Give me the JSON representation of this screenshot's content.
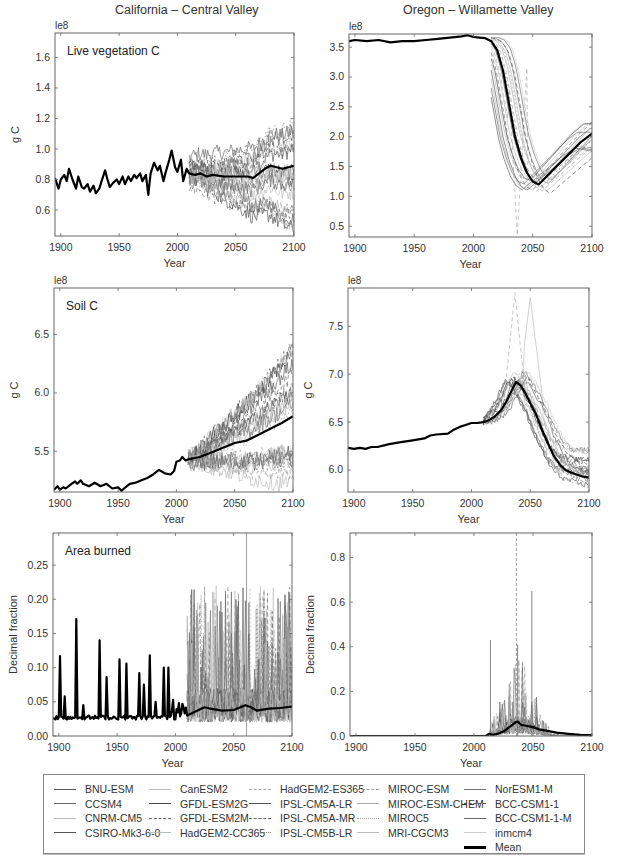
{
  "column_titles": [
    "California – Central Valley",
    "Oregon – Willamette Valley"
  ],
  "legend": {
    "items": [
      {
        "label": "BNU-ESM",
        "style": "solid",
        "color": "#555555",
        "width": 1
      },
      {
        "label": "CCSM4",
        "style": "solid",
        "color": "#666666",
        "width": 1
      },
      {
        "label": "CNRM-CM5",
        "style": "solid",
        "color": "#bbbbbb",
        "width": 1
      },
      {
        "label": "CSIRO-Mk3-6-0",
        "style": "solid",
        "color": "#555555",
        "width": 1
      },
      {
        "label": "CanESM2",
        "style": "solid",
        "color": "#bbbbbb",
        "width": 1
      },
      {
        "label": "GFDL-ESM2G",
        "style": "solid",
        "color": "#444444",
        "width": 1
      },
      {
        "label": "GFDL-ESM2M",
        "style": "dashed",
        "color": "#666666",
        "width": 1
      },
      {
        "label": "HadGEM2-CC365",
        "style": "solid",
        "color": "#bbbbbb",
        "width": 1
      },
      {
        "label": "HadGEM2-ES365",
        "style": "dashed",
        "color": "#aaaaaa",
        "width": 1
      },
      {
        "label": "IPSL-CM5A-LR",
        "style": "solid",
        "color": "#555555",
        "width": 1
      },
      {
        "label": "IPSL-CM5A-MR",
        "style": "dashed",
        "color": "#666666",
        "width": 1
      },
      {
        "label": "IPSL-CM5B-LR",
        "style": "dotted",
        "color": "#777777",
        "width": 1
      },
      {
        "label": "MIROC-ESM",
        "style": "dashed",
        "color": "#999999",
        "width": 1
      },
      {
        "label": "MIROC-ESM-CHEM",
        "style": "solid",
        "color": "#aaaaaa",
        "width": 1
      },
      {
        "label": "MIROC5",
        "style": "dotted",
        "color": "#aaaaaa",
        "width": 1
      },
      {
        "label": "MRI-CGCM3",
        "style": "solid",
        "color": "#bbbbbb",
        "width": 1
      },
      {
        "label": "NorESM1-M",
        "style": "solid",
        "color": "#777777",
        "width": 1
      },
      {
        "label": "BCC-CSM1-1",
        "style": "dashed",
        "color": "#555555",
        "width": 1
      },
      {
        "label": "BCC-CSM1-1-M",
        "style": "solid",
        "color": "#666666",
        "width": 1
      },
      {
        "label": "inmcm4",
        "style": "solid",
        "color": "#cccccc",
        "width": 1
      },
      {
        "label": "Mean",
        "style": "solid",
        "color": "#000000",
        "width": 3
      }
    ]
  },
  "chart_data": [
    {
      "id": "ca-live-veg",
      "type": "line",
      "title": "California – Central Valley",
      "annotation": "Live vegetation C",
      "ylabel": "g C",
      "xlabel": "Year",
      "offset_label": "le8",
      "xlim": [
        1895,
        2100
      ],
      "ylim": [
        0.43,
        1.76
      ],
      "xticks": [
        1900,
        1950,
        2000,
        2050,
        2100
      ],
      "yticks": [
        0.6,
        0.8,
        1.0,
        1.2,
        1.4,
        1.6
      ],
      "ytick_labels": [
        "0.6",
        "0.8",
        "1.0",
        "1.2",
        "1.4",
        "1.6"
      ],
      "mean": {
        "x": [
          1895,
          1898,
          1900,
          1903,
          1905,
          1907,
          1910,
          1913,
          1915,
          1918,
          1920,
          1923,
          1925,
          1928,
          1930,
          1933,
          1935,
          1938,
          1940,
          1942,
          1945,
          1948,
          1950,
          1953,
          1955,
          1958,
          1960,
          1963,
          1965,
          1968,
          1970,
          1973,
          1975,
          1977,
          1980,
          1983,
          1985,
          1988,
          1990,
          1993,
          1995,
          1998,
          2000,
          2003,
          2005,
          2008,
          2010,
          2015,
          2020,
          2025,
          2030,
          2040,
          2050,
          2060,
          2065,
          2070,
          2075,
          2080,
          2085,
          2090,
          2095,
          2100
        ],
        "y": [
          0.81,
          0.74,
          0.8,
          0.83,
          0.79,
          0.87,
          0.8,
          0.74,
          0.82,
          0.75,
          0.74,
          0.77,
          0.72,
          0.76,
          0.71,
          0.74,
          0.79,
          0.86,
          0.8,
          0.75,
          0.78,
          0.8,
          0.77,
          0.82,
          0.77,
          0.82,
          0.79,
          0.83,
          0.81,
          0.84,
          0.79,
          0.83,
          0.7,
          0.84,
          0.91,
          0.86,
          0.89,
          0.79,
          0.85,
          0.93,
          0.99,
          0.88,
          0.85,
          0.93,
          0.79,
          0.87,
          0.84,
          0.83,
          0.84,
          0.82,
          0.83,
          0.82,
          0.82,
          0.82,
          0.81,
          0.84,
          0.87,
          0.89,
          0.88,
          0.87,
          0.88,
          0.89
        ]
      },
      "ensemble_spread": {
        "x_start": 2010,
        "x_end": 2100,
        "low_start": 0.72,
        "high_start": 0.96,
        "low_end": 0.44,
        "high_end": 1.3
      }
    },
    {
      "id": "or-live-veg",
      "type": "line",
      "title": "Oregon – Willamette Valley",
      "annotation": "",
      "ylabel": "",
      "xlabel": "Year",
      "offset_label": "le8",
      "xlim": [
        1895,
        2100
      ],
      "ylim": [
        0.32,
        3.72
      ],
      "xticks": [
        1900,
        1950,
        2000,
        2050,
        2100
      ],
      "yticks": [
        0.5,
        1.0,
        1.5,
        2.0,
        2.5,
        3.0,
        3.5
      ],
      "ytick_labels": [
        "0.5",
        "1.0",
        "1.5",
        "2.0",
        "2.5",
        "3.0",
        "3.5"
      ],
      "mean": {
        "x": [
          1895,
          1900,
          1910,
          1920,
          1930,
          1940,
          1950,
          1960,
          1970,
          1980,
          1990,
          1995,
          2000,
          2005,
          2010,
          2015,
          2020,
          2025,
          2030,
          2035,
          2040,
          2045,
          2050,
          2055,
          2060,
          2070,
          2080,
          2090,
          2100
        ],
        "y": [
          3.6,
          3.62,
          3.6,
          3.62,
          3.58,
          3.6,
          3.6,
          3.62,
          3.64,
          3.66,
          3.68,
          3.7,
          3.67,
          3.66,
          3.65,
          3.6,
          3.45,
          3.1,
          2.55,
          2.0,
          1.65,
          1.4,
          1.25,
          1.2,
          1.3,
          1.5,
          1.7,
          1.9,
          2.05
        ]
      },
      "ensemble_spread": {
        "x_start": 2015,
        "x_end": 2100,
        "low_start": 3.55,
        "high_start": 3.7,
        "low_end": 1.75,
        "high_end": 2.25,
        "min": 0.35,
        "min_year": 2037
      }
    },
    {
      "id": "ca-soil",
      "type": "line",
      "annotation": "Soil C",
      "ylabel": "g C",
      "xlabel": "Year",
      "offset_label": "le8",
      "xlim": [
        1895,
        2100
      ],
      "ylim": [
        5.15,
        6.9
      ],
      "xticks": [
        1900,
        1950,
        2000,
        2050,
        2100
      ],
      "yticks": [
        5.5,
        6.0,
        6.5
      ],
      "ytick_labels": [
        "5.5",
        "6.0",
        "6.5"
      ],
      "mean": {
        "x": [
          1895,
          1898,
          1900,
          1903,
          1905,
          1910,
          1913,
          1915,
          1918,
          1920,
          1925,
          1930,
          1935,
          1940,
          1945,
          1950,
          1953,
          1955,
          1960,
          1965,
          1970,
          1975,
          1980,
          1985,
          1990,
          1995,
          1998,
          2000,
          2003,
          2005,
          2008,
          2010,
          2020,
          2030,
          2040,
          2050,
          2060,
          2070,
          2080,
          2090,
          2100
        ],
        "y": [
          5.17,
          5.2,
          5.17,
          5.19,
          5.18,
          5.22,
          5.24,
          5.22,
          5.25,
          5.22,
          5.2,
          5.23,
          5.2,
          5.22,
          5.18,
          5.19,
          5.16,
          5.18,
          5.22,
          5.23,
          5.25,
          5.27,
          5.3,
          5.34,
          5.31,
          5.3,
          5.33,
          5.41,
          5.42,
          5.45,
          5.42,
          5.43,
          5.45,
          5.49,
          5.53,
          5.57,
          5.59,
          5.64,
          5.69,
          5.74,
          5.8
        ]
      },
      "ensemble_spread": {
        "x_start": 2010,
        "x_end": 2100,
        "low_start": 5.4,
        "high_start": 5.47,
        "low_end": 5.2,
        "high_end": 6.4
      }
    },
    {
      "id": "or-soil",
      "type": "line",
      "annotation": "",
      "ylabel": "g C",
      "xlabel": "Year",
      "offset_label": "le8",
      "xlim": [
        1895,
        2100
      ],
      "ylim": [
        5.77,
        7.9
      ],
      "xticks": [
        1900,
        1950,
        2000,
        2050,
        2100
      ],
      "yticks": [
        6.0,
        6.5,
        7.0,
        7.5
      ],
      "ytick_labels": [
        "6.0",
        "6.5",
        "7.0",
        "7.5"
      ],
      "mean": {
        "x": [
          1895,
          1900,
          1905,
          1910,
          1915,
          1920,
          1930,
          1940,
          1950,
          1960,
          1965,
          1970,
          1980,
          1985,
          1990,
          1995,
          2000,
          2005,
          2010,
          2015,
          2020,
          2025,
          2030,
          2035,
          2038,
          2042,
          2046,
          2050,
          2055,
          2060,
          2065,
          2070,
          2075,
          2080,
          2085,
          2090,
          2095,
          2100
        ],
        "y": [
          6.23,
          6.22,
          6.23,
          6.22,
          6.24,
          6.24,
          6.27,
          6.29,
          6.31,
          6.33,
          6.36,
          6.37,
          6.38,
          6.42,
          6.45,
          6.47,
          6.49,
          6.49,
          6.5,
          6.52,
          6.56,
          6.62,
          6.72,
          6.85,
          6.92,
          6.88,
          6.8,
          6.7,
          6.58,
          6.42,
          6.28,
          6.15,
          6.06,
          6.0,
          5.97,
          5.95,
          5.93,
          5.92
        ]
      },
      "ensemble_spread": {
        "x_start": 2010,
        "x_end": 2100,
        "low_start": 6.45,
        "high_start": 6.55,
        "low_end": 5.8,
        "high_end": 6.25,
        "max": 7.85,
        "max_year": 2037
      }
    },
    {
      "id": "ca-area-burned",
      "type": "line",
      "annotation": "Area burned",
      "ylabel": "Decimal fraction",
      "xlabel": "Year",
      "xlim": [
        1895,
        2100
      ],
      "ylim": [
        0.0,
        0.297
      ],
      "xticks": [
        1900,
        1950,
        2000,
        2050,
        2100
      ],
      "yticks": [
        0.0,
        0.05,
        0.1,
        0.15,
        0.2,
        0.25
      ],
      "ytick_labels": [
        "0.00",
        "0.05",
        "0.10",
        "0.15",
        "0.20",
        "0.25"
      ],
      "mean_baseline": 0.027,
      "mean_spikes": [
        {
          "year": 1901,
          "value": 0.117
        },
        {
          "year": 1905,
          "value": 0.058
        },
        {
          "year": 1915,
          "value": 0.171
        },
        {
          "year": 1921,
          "value": 0.045
        },
        {
          "year": 1935,
          "value": 0.14
        },
        {
          "year": 1941,
          "value": 0.086
        },
        {
          "year": 1952,
          "value": 0.112
        },
        {
          "year": 1958,
          "value": 0.106
        },
        {
          "year": 1969,
          "value": 0.092
        },
        {
          "year": 1973,
          "value": 0.075
        },
        {
          "year": 1978,
          "value": 0.118
        },
        {
          "year": 1983,
          "value": 0.05
        },
        {
          "year": 1990,
          "value": 0.1
        },
        {
          "year": 1994,
          "value": 0.1
        },
        {
          "year": 1998,
          "value": 0.053
        },
        {
          "year": 2003,
          "value": 0.048
        },
        {
          "year": 2006,
          "value": 0.047
        }
      ],
      "future_mean": {
        "x": [
          2010,
          2015,
          2020,
          2025,
          2030,
          2040,
          2050,
          2060,
          2065,
          2070,
          2080,
          2090,
          2100
        ],
        "y": [
          0.03,
          0.034,
          0.038,
          0.042,
          0.04,
          0.037,
          0.038,
          0.045,
          0.042,
          0.037,
          0.04,
          0.041,
          0.043
        ]
      },
      "ensemble_spikes_max": 0.297
    },
    {
      "id": "or-area-burned",
      "type": "line",
      "annotation": "",
      "ylabel": "Decimal fraction",
      "xlabel": "Year",
      "xlim": [
        1895,
        2100
      ],
      "ylim": [
        0.0,
        0.91
      ],
      "xticks": [
        1900,
        1950,
        2000,
        2050,
        2100
      ],
      "yticks": [
        0.0,
        0.2,
        0.4,
        0.6,
        0.8
      ],
      "ytick_labels": [
        "0.0",
        "0.2",
        "0.4",
        "0.6",
        "0.8"
      ],
      "mean": {
        "x": [
          1895,
          2010,
          2013,
          2016,
          2020,
          2025,
          2030,
          2035,
          2037,
          2040,
          2045,
          2050,
          2055,
          2060,
          2070,
          2080,
          2090,
          2100
        ],
        "y": [
          0.0,
          0.0,
          0.01,
          0.005,
          0.01,
          0.02,
          0.04,
          0.06,
          0.065,
          0.05,
          0.045,
          0.04,
          0.03,
          0.025,
          0.015,
          0.01,
          0.005,
          0.004
        ]
      },
      "ensemble_spikes_max": 0.91,
      "notable_spikes": [
        {
          "year": 2036,
          "value": 0.91
        },
        {
          "year": 2049,
          "value": 0.65
        },
        {
          "year": 2037,
          "value": 0.41
        },
        {
          "year": 2014,
          "value": 0.43
        }
      ]
    }
  ]
}
